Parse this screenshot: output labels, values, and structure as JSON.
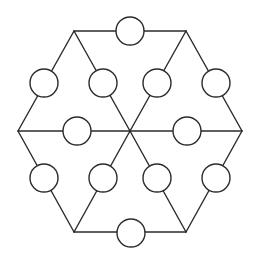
{
  "diagram": {
    "type": "hexagon-magic-puzzle",
    "colors": {
      "line": "#2b2b2b",
      "circle_fill": "#ffffff",
      "background": "#ffffff"
    },
    "center": {
      "x": 130,
      "y": 131
    },
    "vertices": [
      {
        "id": "v-left",
        "x": 18,
        "y": 131
      },
      {
        "id": "v-top-left",
        "x": 74,
        "y": 31
      },
      {
        "id": "v-top-right",
        "x": 186,
        "y": 31
      },
      {
        "id": "v-right",
        "x": 242,
        "y": 131
      },
      {
        "id": "v-bottom-right",
        "x": 186,
        "y": 232
      },
      {
        "id": "v-bottom-left",
        "x": 74,
        "y": 232
      }
    ],
    "circle_radius": 14,
    "circles": [
      {
        "id": "c-top",
        "x": 130,
        "y": 31,
        "label": ""
      },
      {
        "id": "c-upper-left-outer",
        "x": 44,
        "y": 83,
        "label": ""
      },
      {
        "id": "c-upper-left-inner",
        "x": 103,
        "y": 83,
        "label": ""
      },
      {
        "id": "c-upper-right-inner",
        "x": 157,
        "y": 83,
        "label": ""
      },
      {
        "id": "c-upper-right-outer",
        "x": 216,
        "y": 83,
        "label": ""
      },
      {
        "id": "c-mid-left",
        "x": 77,
        "y": 131,
        "label": ""
      },
      {
        "id": "c-mid-right",
        "x": 187,
        "y": 131,
        "label": ""
      },
      {
        "id": "c-lower-left-outer",
        "x": 44,
        "y": 178,
        "label": ""
      },
      {
        "id": "c-lower-left-inner",
        "x": 103,
        "y": 178,
        "label": ""
      },
      {
        "id": "c-lower-right-inner",
        "x": 157,
        "y": 178,
        "label": ""
      },
      {
        "id": "c-lower-right-outer",
        "x": 216,
        "y": 178,
        "label": ""
      },
      {
        "id": "c-bottom",
        "x": 131,
        "y": 233,
        "label": ""
      }
    ]
  }
}
